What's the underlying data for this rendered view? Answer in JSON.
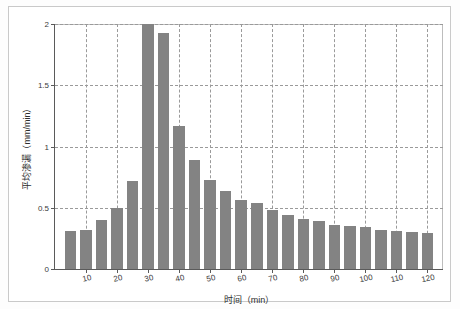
{
  "chart_data": {
    "type": "bar",
    "title": "",
    "xlabel": "时间（min）",
    "ylabel": "平均渗漏（mm/min）",
    "xlim": [
      0,
      125
    ],
    "ylim": [
      0,
      2
    ],
    "grid": true,
    "legend": null,
    "bar_color": "#838383",
    "x": [
      5,
      10,
      15,
      20,
      25,
      30,
      35,
      40,
      45,
      50,
      55,
      60,
      65,
      70,
      75,
      80,
      85,
      90,
      95,
      100,
      105,
      110,
      115,
      120
    ],
    "values": [
      0.31,
      0.32,
      0.4,
      0.5,
      0.72,
      2.0,
      1.93,
      1.17,
      0.89,
      0.73,
      0.64,
      0.56,
      0.54,
      0.48,
      0.44,
      0.41,
      0.39,
      0.36,
      0.35,
      0.34,
      0.32,
      0.31,
      0.3,
      0.29
    ],
    "ytick_labels": [
      "0",
      "0.5",
      "1",
      "1.5",
      "2"
    ],
    "ytick_values": [
      0,
      0.5,
      1,
      1.5,
      2
    ],
    "xtick_labels": [
      "10",
      "20",
      "30",
      "40",
      "50",
      "60",
      "70",
      "80",
      "90",
      "100",
      "110",
      "120"
    ],
    "xtick_values": [
      10,
      20,
      30,
      40,
      50,
      60,
      70,
      80,
      90,
      100,
      110,
      120
    ]
  }
}
